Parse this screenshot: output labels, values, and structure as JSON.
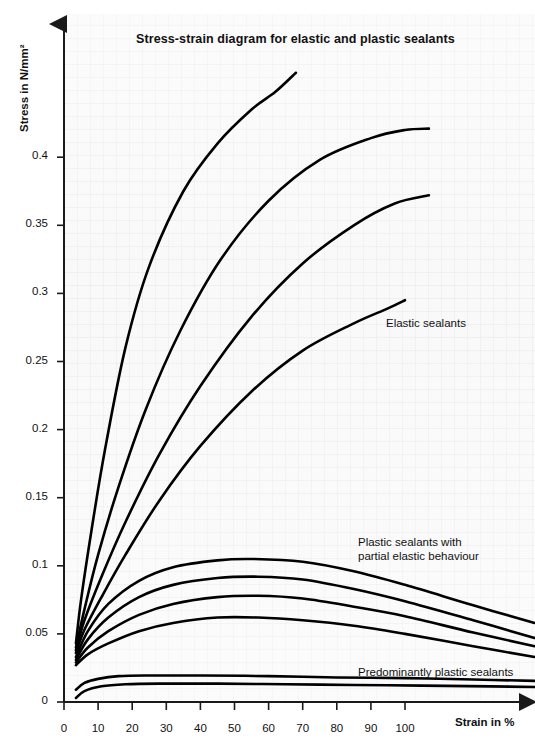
{
  "chart_data": {
    "type": "line",
    "title": "Stress-strain diagram for elastic and plastic sealants",
    "xlabel": "Strain in %",
    "ylabel": "Stress in N/mm²",
    "xlim": [
      0,
      138
    ],
    "ylim": [
      0,
      0.5
    ],
    "xticks": [
      0,
      10,
      20,
      30,
      40,
      50,
      60,
      70,
      80,
      90,
      100
    ],
    "xticklabels": [
      "0",
      "10",
      "20",
      "30",
      "40",
      "50",
      "60",
      "70",
      "80",
      "90",
      "100"
    ],
    "yticks": [
      0,
      0.05,
      0.1,
      0.15,
      0.2,
      0.25,
      0.3,
      0.35,
      0.4
    ],
    "yticklabels": [
      "0",
      "0.05",
      "0.1",
      "0.15",
      "0.2",
      "0.25",
      "0.3",
      "0.35",
      "0.4"
    ],
    "grid": true,
    "legend": "none",
    "series": [
      {
        "name": "Elastic sealant 1",
        "group": "Elastic sealants",
        "points": [
          [
            3.5,
            0.043
          ],
          [
            5,
            0.075
          ],
          [
            8,
            0.125
          ],
          [
            12,
            0.185
          ],
          [
            18,
            0.26
          ],
          [
            25,
            0.32
          ],
          [
            35,
            0.375
          ],
          [
            45,
            0.41
          ],
          [
            55,
            0.435
          ],
          [
            62,
            0.448
          ],
          [
            68,
            0.462
          ]
        ]
      },
      {
        "name": "Elastic sealant 2",
        "group": "Elastic sealants",
        "points": [
          [
            3.5,
            0.04
          ],
          [
            6,
            0.068
          ],
          [
            10,
            0.108
          ],
          [
            16,
            0.158
          ],
          [
            24,
            0.215
          ],
          [
            34,
            0.272
          ],
          [
            46,
            0.325
          ],
          [
            60,
            0.368
          ],
          [
            75,
            0.398
          ],
          [
            90,
            0.414
          ],
          [
            100,
            0.42
          ],
          [
            107,
            0.421
          ]
        ]
      },
      {
        "name": "Elastic sealant 3",
        "group": "Elastic sealants",
        "points": [
          [
            3.5,
            0.038
          ],
          [
            6,
            0.06
          ],
          [
            11,
            0.092
          ],
          [
            18,
            0.132
          ],
          [
            28,
            0.182
          ],
          [
            40,
            0.232
          ],
          [
            55,
            0.283
          ],
          [
            70,
            0.322
          ],
          [
            85,
            0.35
          ],
          [
            97,
            0.366
          ],
          [
            107,
            0.372
          ]
        ]
      },
      {
        "name": "Elastic sealant 4",
        "group": "Elastic sealants",
        "points": [
          [
            3.5,
            0.036
          ],
          [
            6,
            0.053
          ],
          [
            11,
            0.077
          ],
          [
            18,
            0.108
          ],
          [
            28,
            0.148
          ],
          [
            40,
            0.188
          ],
          [
            55,
            0.228
          ],
          [
            70,
            0.258
          ],
          [
            85,
            0.278
          ],
          [
            95,
            0.289
          ],
          [
            100,
            0.295
          ]
        ]
      },
      {
        "name": "Plastic-elastic sealant 1",
        "group": "Plastic sealants with partial elastic behaviour",
        "points": [
          [
            3.5,
            0.033
          ],
          [
            7,
            0.052
          ],
          [
            13,
            0.072
          ],
          [
            22,
            0.089
          ],
          [
            32,
            0.099
          ],
          [
            45,
            0.104
          ],
          [
            55,
            0.105
          ],
          [
            70,
            0.103
          ],
          [
            85,
            0.096
          ],
          [
            100,
            0.086
          ],
          [
            120,
            0.071
          ],
          [
            138,
            0.058
          ]
        ]
      },
      {
        "name": "Plastic-elastic sealant 2",
        "group": "Plastic sealants with partial elastic behaviour",
        "points": [
          [
            3.5,
            0.031
          ],
          [
            7,
            0.046
          ],
          [
            13,
            0.062
          ],
          [
            22,
            0.077
          ],
          [
            32,
            0.086
          ],
          [
            45,
            0.091
          ],
          [
            57,
            0.092
          ],
          [
            70,
            0.09
          ],
          [
            85,
            0.083
          ],
          [
            100,
            0.074
          ],
          [
            120,
            0.06
          ],
          [
            138,
            0.047
          ]
        ]
      },
      {
        "name": "Plastic-elastic sealant 3",
        "group": "Plastic sealants with partial elastic behaviour",
        "points": [
          [
            3.5,
            0.029
          ],
          [
            7,
            0.04
          ],
          [
            13,
            0.052
          ],
          [
            22,
            0.064
          ],
          [
            32,
            0.072
          ],
          [
            45,
            0.077
          ],
          [
            57,
            0.078
          ],
          [
            70,
            0.076
          ],
          [
            85,
            0.07
          ],
          [
            100,
            0.063
          ],
          [
            120,
            0.051
          ],
          [
            138,
            0.041
          ]
        ]
      },
      {
        "name": "Plastic-elastic sealant 4",
        "group": "Plastic sealants with partial elastic behaviour",
        "points": [
          [
            3.5,
            0.027
          ],
          [
            7,
            0.035
          ],
          [
            13,
            0.043
          ],
          [
            22,
            0.052
          ],
          [
            32,
            0.058
          ],
          [
            45,
            0.062
          ],
          [
            57,
            0.062
          ],
          [
            70,
            0.06
          ],
          [
            85,
            0.056
          ],
          [
            100,
            0.05
          ],
          [
            120,
            0.041
          ],
          [
            138,
            0.033
          ]
        ]
      },
      {
        "name": "Predominantly plastic sealant 1",
        "group": "Predominantly plastic sealants",
        "points": [
          [
            3.5,
            0.009
          ],
          [
            6,
            0.014
          ],
          [
            10,
            0.017
          ],
          [
            16,
            0.019
          ],
          [
            25,
            0.0195
          ],
          [
            40,
            0.0195
          ],
          [
            60,
            0.019
          ],
          [
            80,
            0.018
          ],
          [
            100,
            0.0175
          ],
          [
            120,
            0.0165
          ],
          [
            138,
            0.0155
          ]
        ]
      },
      {
        "name": "Predominantly plastic sealant 2",
        "group": "Predominantly plastic sealants",
        "points": [
          [
            3.5,
            0.003
          ],
          [
            6,
            0.008
          ],
          [
            11,
            0.0115
          ],
          [
            18,
            0.013
          ],
          [
            28,
            0.0135
          ],
          [
            45,
            0.0135
          ],
          [
            65,
            0.013
          ],
          [
            85,
            0.0125
          ],
          [
            105,
            0.012
          ],
          [
            125,
            0.0115
          ],
          [
            138,
            0.011
          ]
        ]
      }
    ],
    "annotations": [
      {
        "text": "Elastic sealants",
        "x_px": 386,
        "y_px": 316
      },
      {
        "text": "Plastic sealants with",
        "x_px": 358,
        "y_px": 535
      },
      {
        "text": "partial elastic behaviour",
        "x_px": 358,
        "y_px": 549
      },
      {
        "text": "Predominantly plastic sealants",
        "x_px": 358,
        "y_px": 665
      }
    ]
  },
  "figure": {
    "title": "Stress-strain diagram for elastic and plastic sealants",
    "y_axis_title": "Stress in N/mm²",
    "x_axis_title": "Strain in %",
    "annotation_elastic": "Elastic sealants",
    "annotation_plastic_elastic_line1": "Plastic sealants with",
    "annotation_plastic_elastic_line2": "partial elastic behaviour",
    "annotation_plastic": "Predominantly plastic sealants",
    "caption": "",
    "colors": {
      "curve": "#000000",
      "axis": "#1a1a1a",
      "plot_background": "#f7f7f7",
      "text": "#111111"
    }
  }
}
